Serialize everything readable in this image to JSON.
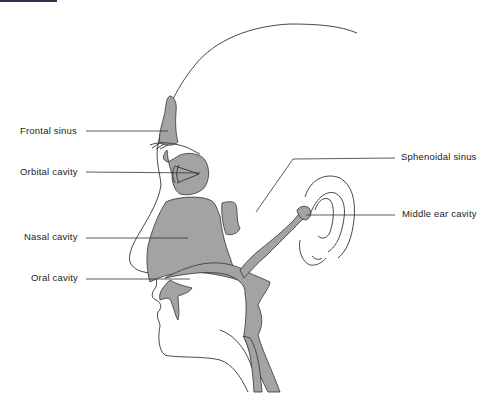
{
  "figure": {
    "colors": {
      "cavity_fill": "#a3a3a3",
      "outline": "#333333",
      "label_text": "#222222",
      "background": "#ffffff",
      "top_bar": "#2c3550"
    }
  },
  "labels": {
    "frontal_sinus": "Frontal sinus",
    "orbital_cavity": "Orbital cavity",
    "nasal_cavity": "Nasal cavity",
    "oral_cavity": "Oral cavity",
    "sphenoidal_sinus": "Sphenoidal sinus",
    "middle_ear_cavity": "Middle ear cavity"
  }
}
